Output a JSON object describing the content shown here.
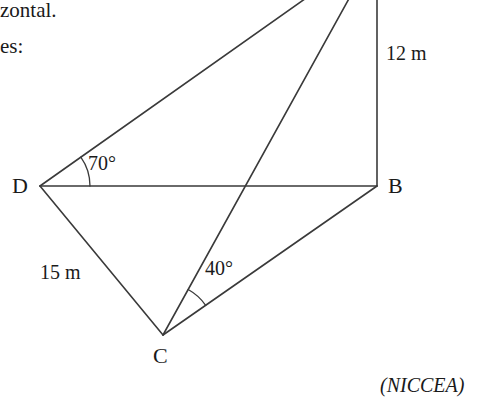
{
  "page": {
    "width": 496,
    "height": 401,
    "background": "#ffffff",
    "ink_color": "#333333",
    "text_color": "#1a1a1a"
  },
  "prose": {
    "line1": "zontal.",
    "line2": "es:"
  },
  "attribution": {
    "text": "(NICCEA)"
  },
  "diagram": {
    "type": "geometry-figure",
    "vertices": [
      {
        "id": "D",
        "label": "D",
        "x": 40,
        "y": 186,
        "label_x": 12,
        "label_y": 175
      },
      {
        "id": "B",
        "label": "B",
        "x": 377,
        "y": 186,
        "label_x": 388,
        "label_y": 175
      },
      {
        "id": "C",
        "label": "C",
        "x": 163,
        "y": 335,
        "label_x": 153,
        "label_y": 345
      },
      {
        "id": "A",
        "label": "",
        "x": 377,
        "y": -52,
        "label_x": 0,
        "label_y": 0
      }
    ],
    "edges": [
      {
        "id": "D-A",
        "from": "D",
        "to": "A"
      },
      {
        "id": "C-A",
        "from": "C",
        "to": "A"
      },
      {
        "id": "A-B",
        "from": "A",
        "to": "B"
      },
      {
        "id": "D-B",
        "from": "D",
        "to": "B"
      },
      {
        "id": "D-C",
        "from": "D",
        "to": "C"
      },
      {
        "id": "C-B",
        "from": "C",
        "to": "B"
      }
    ],
    "measures": [
      {
        "id": "AB",
        "label": "12 m",
        "x": 386,
        "y": 43,
        "edge": "A-B"
      },
      {
        "id": "DC",
        "label": "15 m",
        "x": 40,
        "y": 262,
        "edge": "D-C"
      }
    ],
    "angles": [
      {
        "id": "angle-D",
        "label": "70°",
        "value": 70,
        "vertex": "D",
        "label_x": 88,
        "label_y": 153,
        "arc_radius": 50
      },
      {
        "id": "angle-C",
        "label": "40°",
        "value": 40,
        "vertex": "C",
        "label_x": 205,
        "label_y": 258,
        "arc_radius": 52
      }
    ]
  }
}
